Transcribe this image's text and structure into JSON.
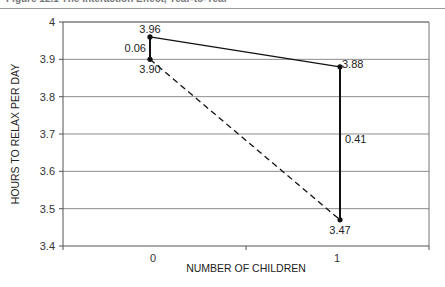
{
  "header": {
    "cropped_title": "Figure 12.1  The Interaction Effect, Year-to-Year"
  },
  "chart_data": {
    "type": "line",
    "title": "",
    "xlabel": "NUMBER OF CHILDREN",
    "ylabel": "HOURS TO RELAX PER DAY",
    "categories": [
      "0",
      "1"
    ],
    "ylim": [
      3.4,
      4.0
    ],
    "yticks": [
      "3.4",
      "3.5",
      "3.6",
      "3.7",
      "3.8",
      "3.9",
      "4"
    ],
    "grid": true,
    "legend": "none",
    "series": [
      {
        "name": "upper (solid)",
        "style": "solid",
        "values": [
          3.96,
          3.88
        ],
        "labels": [
          "3.96",
          "3.88"
        ]
      },
      {
        "name": "lower (dashed)",
        "style": "dashed",
        "values": [
          3.9,
          3.47
        ],
        "labels": [
          "3.90",
          "3.47"
        ]
      }
    ],
    "annotations": [
      {
        "category": "0",
        "type": "difference",
        "label": "0.06",
        "from": 3.9,
        "to": 3.96
      },
      {
        "category": "1",
        "type": "difference",
        "label": "0.41",
        "from": 3.47,
        "to": 3.88
      }
    ]
  }
}
